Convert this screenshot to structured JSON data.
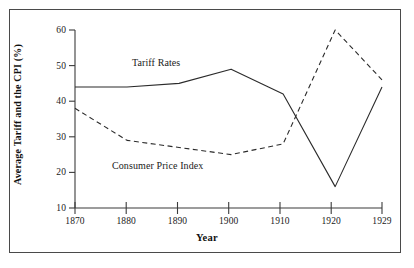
{
  "figure": {
    "background_color": "#ffffff",
    "frame_color": "#4a4a4a",
    "ink_color": "#2b2b2b"
  },
  "chart_data": {
    "type": "line",
    "title": "",
    "xlabel": "Year",
    "ylabel": "Average Tariff and the CPI (%)",
    "x": [
      1870,
      1880,
      1890,
      1900,
      1910,
      1920,
      1929
    ],
    "xtick_labels": [
      "1870",
      "1880",
      "1890",
      "1900",
      "1910",
      "1920",
      "1929"
    ],
    "ytick_labels": [
      "10",
      "20",
      "30",
      "40",
      "50",
      "60"
    ],
    "yticks": [
      10,
      20,
      30,
      40,
      50,
      60
    ],
    "xlim": [
      1870,
      1929
    ],
    "ylim": [
      10,
      60
    ],
    "grid": false,
    "legend_position": "inline-annotations",
    "series": [
      {
        "name": "Tariff Rates",
        "style": "solid",
        "values": [
          44,
          44,
          45,
          49,
          42,
          16,
          44
        ],
        "annotation": "Tariff Rates"
      },
      {
        "name": "Consumer Price Index",
        "style": "dashed",
        "values": [
          38,
          29,
          27,
          25,
          28,
          60,
          46
        ],
        "annotation": "Consumer Price Index"
      }
    ]
  }
}
